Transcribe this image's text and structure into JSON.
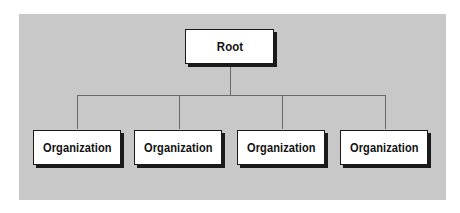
{
  "diagram": {
    "type": "org-chart",
    "root": {
      "label": "Root"
    },
    "children": [
      {
        "label": "Organization"
      },
      {
        "label": "Organization"
      },
      {
        "label": "Organization"
      },
      {
        "label": "Organization"
      }
    ],
    "colors": {
      "background": "#c8c8c8",
      "node_fill": "#ffffff",
      "node_border": "#1a1a1a",
      "connector": "#6a6a6a"
    }
  }
}
